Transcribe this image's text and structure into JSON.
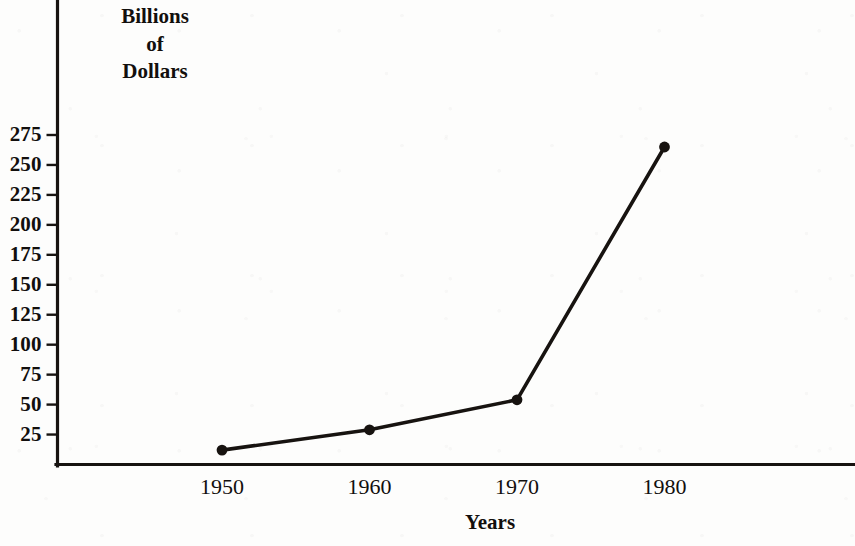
{
  "chart_data": {
    "type": "line",
    "title": "",
    "xlabel": "Years",
    "ylabel": "Billions of Dollars",
    "ylabel_lines": [
      "Billions",
      "of",
      "Dollars"
    ],
    "x": [
      1950,
      1960,
      1970,
      1980
    ],
    "categories": [
      "1950",
      "1960",
      "1970",
      "1980"
    ],
    "values": [
      12,
      29,
      54,
      265
    ],
    "series": [
      {
        "name": "Billions of Dollars",
        "values": [
          12,
          29,
          54,
          265
        ]
      }
    ],
    "xtick_labels": [
      "1950",
      "1960",
      "1970",
      "1980"
    ],
    "ytick_labels": [
      "275",
      "250",
      "225",
      "200",
      "175",
      "150",
      "125",
      "100",
      "75",
      "50",
      "25"
    ],
    "ytick_values": [
      275,
      250,
      225,
      200,
      175,
      150,
      125,
      100,
      75,
      50,
      25
    ],
    "ylim": [
      0,
      300
    ],
    "xlim": [
      1942,
      1995
    ],
    "grid": false,
    "legend": false,
    "marker": "filled-circle",
    "line_color": "#171310",
    "marker_color": "#171310",
    "background_color": "#fdfdfc"
  }
}
